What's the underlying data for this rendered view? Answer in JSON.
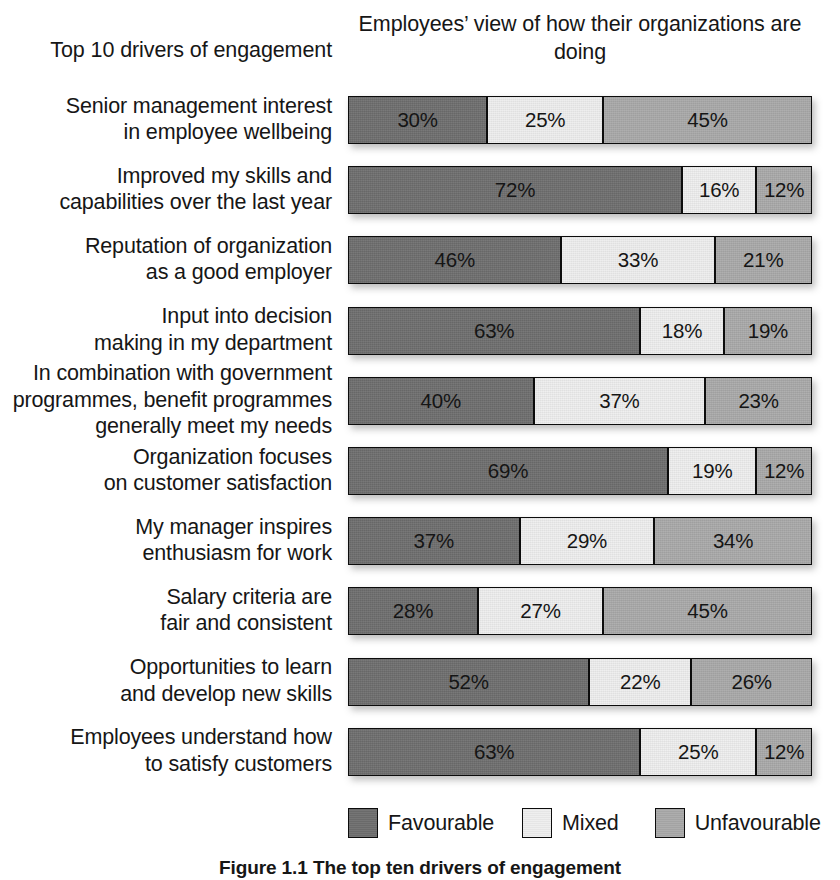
{
  "headers": {
    "left": "Top 10 drivers of engagement",
    "right_line1": "Employees’ view of how their",
    "right_line2": "organizations are doing"
  },
  "legend": {
    "items": [
      {
        "label": "Favourable",
        "key": "fav",
        "color": "#6e6e6e"
      },
      {
        "label": "Mixed",
        "key": "mix",
        "color": "#eeeeee"
      },
      {
        "label": "Unfavourable",
        "key": "unf",
        "color": "#a9a9a9"
      }
    ]
  },
  "caption": "Figure 1.1  The top ten drivers of engagement",
  "chart_data": {
    "type": "bar",
    "subtype": "stacked-horizontal-100pct",
    "title": "Top 10 drivers of engagement",
    "subtitle": "Employees’ view of how their organizations are doing",
    "xlabel": "",
    "ylabel": "",
    "xlim": [
      0,
      100
    ],
    "grid": false,
    "legend_position": "bottom",
    "value_suffix": "%",
    "colors": {
      "Favourable": "#6e6e6e",
      "Mixed": "#eeeeee",
      "Unfavourable": "#a9a9a9"
    },
    "categories": [
      "Senior management interest in employee wellbeing",
      "Improved my skills and capabilities over the last year",
      "Reputation of organization as a good employer",
      "Input into decision making in my department",
      "In combination with government programmes, benefit programmes generally meet my needs",
      "Organization focuses on customer satisfaction",
      "My manager inspires enthusiasm for work",
      "Salary criteria are fair and consistent",
      "Opportunities to learn and develop new skills",
      "Employees understand how to satisfy customers"
    ],
    "series": [
      {
        "name": "Favourable",
        "values": [
          30,
          72,
          46,
          63,
          40,
          69,
          37,
          28,
          52,
          63
        ]
      },
      {
        "name": "Mixed",
        "values": [
          25,
          16,
          33,
          18,
          37,
          19,
          29,
          27,
          22,
          25
        ]
      },
      {
        "name": "Unfavourable",
        "values": [
          45,
          12,
          21,
          19,
          23,
          12,
          34,
          45,
          26,
          12
        ]
      }
    ]
  },
  "rows": [
    {
      "label_lines": [
        "Senior management interest",
        "in employee wellbeing"
      ],
      "segments": [
        {
          "key": "fav",
          "value": 30,
          "text": "30%"
        },
        {
          "key": "mix",
          "value": 25,
          "text": "25%"
        },
        {
          "key": "unf",
          "value": 45,
          "text": "45%"
        }
      ]
    },
    {
      "label_lines": [
        "Improved my skills and",
        "capabilities over the last year"
      ],
      "segments": [
        {
          "key": "fav",
          "value": 72,
          "text": "72%"
        },
        {
          "key": "mix",
          "value": 16,
          "text": "16%"
        },
        {
          "key": "unf",
          "value": 12,
          "text": "12%"
        }
      ]
    },
    {
      "label_lines": [
        "Reputation of organization",
        "as a good employer"
      ],
      "segments": [
        {
          "key": "fav",
          "value": 46,
          "text": "46%"
        },
        {
          "key": "mix",
          "value": 33,
          "text": "33%"
        },
        {
          "key": "unf",
          "value": 21,
          "text": "21%"
        }
      ]
    },
    {
      "label_lines": [
        "Input into decision",
        "making in my department"
      ],
      "segments": [
        {
          "key": "fav",
          "value": 63,
          "text": "63%"
        },
        {
          "key": "mix",
          "value": 18,
          "text": "18%"
        },
        {
          "key": "unf",
          "value": 19,
          "text": "19%"
        }
      ]
    },
    {
      "label_lines": [
        "In combination with government",
        "programmes, benefit programmes",
        "generally meet my needs"
      ],
      "segments": [
        {
          "key": "fav",
          "value": 40,
          "text": "40%"
        },
        {
          "key": "mix",
          "value": 37,
          "text": "37%"
        },
        {
          "key": "unf",
          "value": 23,
          "text": "23%"
        }
      ]
    },
    {
      "label_lines": [
        "Organization focuses",
        "on customer satisfaction"
      ],
      "segments": [
        {
          "key": "fav",
          "value": 69,
          "text": "69%"
        },
        {
          "key": "mix",
          "value": 19,
          "text": "19%"
        },
        {
          "key": "unf",
          "value": 12,
          "text": "12%"
        }
      ]
    },
    {
      "label_lines": [
        "My manager inspires",
        "enthusiasm for work"
      ],
      "segments": [
        {
          "key": "fav",
          "value": 37,
          "text": "37%"
        },
        {
          "key": "mix",
          "value": 29,
          "text": "29%"
        },
        {
          "key": "unf",
          "value": 34,
          "text": "34%"
        }
      ]
    },
    {
      "label_lines": [
        "Salary criteria are",
        "fair and consistent"
      ],
      "segments": [
        {
          "key": "fav",
          "value": 28,
          "text": "28%"
        },
        {
          "key": "mix",
          "value": 27,
          "text": "27%"
        },
        {
          "key": "unf",
          "value": 45,
          "text": "45%"
        }
      ]
    },
    {
      "label_lines": [
        "Opportunities to learn",
        "and develop new skills"
      ],
      "segments": [
        {
          "key": "fav",
          "value": 52,
          "text": "52%"
        },
        {
          "key": "mix",
          "value": 22,
          "text": "22%"
        },
        {
          "key": "unf",
          "value": 26,
          "text": "26%"
        }
      ]
    },
    {
      "label_lines": [
        "Employees understand how",
        "to satisfy customers"
      ],
      "segments": [
        {
          "key": "fav",
          "value": 63,
          "text": "63%"
        },
        {
          "key": "mix",
          "value": 25,
          "text": "25%"
        },
        {
          "key": "unf",
          "value": 12,
          "text": "12%"
        }
      ]
    }
  ]
}
